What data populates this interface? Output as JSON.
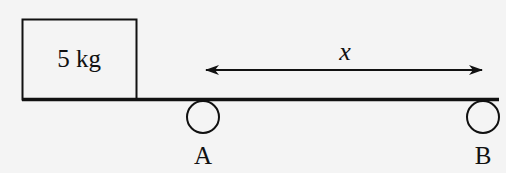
{
  "diagram": {
    "block": {
      "label": "5 kg"
    },
    "displacement": {
      "label": "x"
    },
    "supports": [
      {
        "label": "A"
      },
      {
        "label": "B"
      }
    ],
    "colors": {
      "stroke": "#111111",
      "background": "#f4f4f4"
    }
  }
}
